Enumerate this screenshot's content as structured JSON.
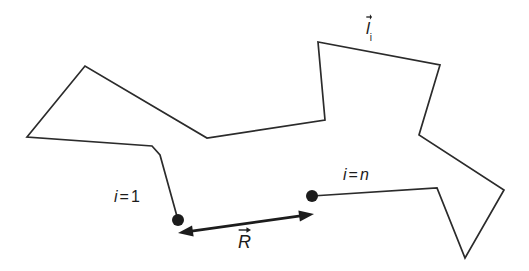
{
  "figure": {
    "name": "random-walk-chain-diagram",
    "background_color": "#ffffff",
    "stroke_color": "#2b2b2b",
    "marker_color": "#1c1c1c"
  },
  "labels": {
    "segment_vector": {
      "symbol": "l",
      "subscript": "i",
      "has_vector_arrow": true,
      "x": 366,
      "y": 20
    },
    "start_index": {
      "var": "i",
      "eq": "=",
      "value": "1",
      "text": "i = 1",
      "x": 114,
      "y": 189
    },
    "end_index": {
      "var": "i",
      "eq": "=",
      "value": "n",
      "text": "i = n",
      "x": 343,
      "y": 167
    },
    "end_to_end_vector": {
      "symbol": "R",
      "has_vector_arrow": true,
      "x": 238,
      "y": 233
    }
  },
  "chart_data": {
    "type": "line",
    "title": "",
    "xlabel": "",
    "ylabel": "",
    "grid": false,
    "legend": "none",
    "xlim": [
      0,
      529
    ],
    "ylim": [
      0,
      271
    ],
    "note": "Pixel coordinates in image space; y increases downward.",
    "chain_vertices": [
      [
        178,
        220
      ],
      [
        160,
        155
      ],
      [
        152,
        146
      ],
      [
        27,
        137
      ],
      [
        85,
        66
      ],
      [
        207,
        138
      ],
      [
        325,
        120
      ],
      [
        318,
        42
      ],
      [
        440,
        65
      ],
      [
        419,
        135
      ],
      [
        504,
        190
      ],
      [
        465,
        258
      ],
      [
        437,
        188
      ],
      [
        312,
        196
      ]
    ],
    "nodes": [
      {
        "name": "i = 1",
        "x": 178,
        "y": 220,
        "radius": 6
      },
      {
        "name": "i = n",
        "x": 312,
        "y": 196,
        "radius": 6
      }
    ],
    "end_to_end_arrow": {
      "name": "R",
      "from": [
        178,
        233
      ],
      "to": [
        314,
        214
      ],
      "double_headed": true
    }
  }
}
